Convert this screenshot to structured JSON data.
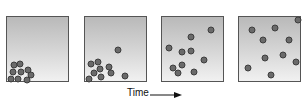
{
  "diagram": {
    "time_label": "Time",
    "colors": {
      "particle": "#6a6a6a",
      "particle_edge": "#3d3d3d",
      "box_border": "#555555",
      "box_top": "#b9b9b9",
      "box_bottom": "#f1f1f1"
    },
    "panels": [
      {
        "id": 1,
        "left": 6,
        "particles": [
          [
            14,
            65
          ],
          [
            20,
            64
          ],
          [
            13,
            72
          ],
          [
            21,
            72
          ],
          [
            28,
            70
          ],
          [
            31,
            75
          ],
          [
            11,
            79
          ],
          [
            18,
            79
          ],
          [
            27,
            80
          ]
        ]
      },
      {
        "id": 2,
        "left": 84,
        "particles": [
          [
            118,
            50
          ],
          [
            91,
            64
          ],
          [
            98,
            62
          ],
          [
            109,
            67
          ],
          [
            94,
            73
          ],
          [
            100,
            69
          ],
          [
            111,
            73
          ],
          [
            125,
            76
          ],
          [
            89,
            79
          ],
          [
            101,
            77
          ]
        ]
      },
      {
        "id": 3,
        "left": 161,
        "particles": [
          [
            211,
            30
          ],
          [
            191,
            37
          ],
          [
            169,
            48
          ],
          [
            182,
            52
          ],
          [
            191,
            51
          ],
          [
            204,
            60
          ],
          [
            173,
            68
          ],
          [
            182,
            65
          ],
          [
            178,
            73
          ],
          [
            194,
            72
          ]
        ]
      },
      {
        "id": 4,
        "left": 238,
        "particles": [
          [
            298,
            20
          ],
          [
            252,
            30
          ],
          [
            275,
            28
          ],
          [
            263,
            40
          ],
          [
            289,
            40
          ],
          [
            265,
            58
          ],
          [
            283,
            55
          ],
          [
            296,
            62
          ],
          [
            248,
            68
          ],
          [
            271,
            75
          ]
        ]
      }
    ]
  }
}
